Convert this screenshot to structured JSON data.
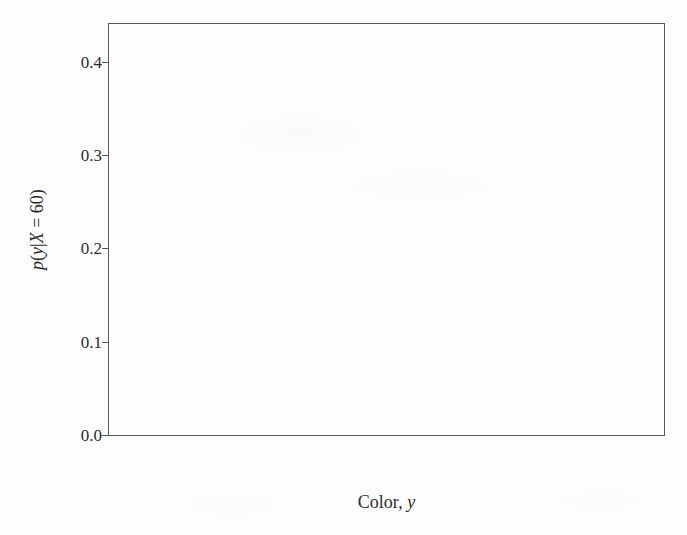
{
  "figure": {
    "background_color": "#fefefe",
    "axis_color": "#58585a",
    "stem_color": "#6a6a6c",
    "text_color": "#2b2b2b"
  },
  "axes": {
    "xlabel_prefix": "Color, ",
    "xlabel_italic": "y",
    "ylabel_parts": {
      "p": "p",
      "open": "(",
      "y": "y",
      "bar": "|",
      "X": "X",
      "eq": " = 60",
      "close": ")"
    },
    "ylabel_plain": "p(y|X = 60)",
    "ytick_labels": [
      "0.0",
      "0.1",
      "0.2",
      "0.3",
      "0.4"
    ],
    "ytick_values": [
      0.0,
      0.1,
      0.2,
      0.3,
      0.4
    ],
    "xtick_labels": [
      "Red",
      "Gray",
      "Green"
    ]
  },
  "chart_data": {
    "type": "bar",
    "subtype": "stem",
    "title": "",
    "subtitle": "",
    "xlabel": "Color, y",
    "ylabel": "p(y|X = 60)",
    "categories": [
      "Red",
      "Gray",
      "Green"
    ],
    "values": [
      0.2,
      0.4,
      0.398
    ],
    "ylim": [
      0.0,
      0.4405
    ],
    "xlim": [
      0.0,
      1.0
    ],
    "ytick_values": [
      0.0,
      0.1,
      0.2,
      0.3,
      0.4
    ],
    "ytick_labels": [
      "0.0",
      "0.1",
      "0.2",
      "0.3",
      "0.4"
    ],
    "xtick_positions": [
      0.0951,
      0.4973,
      0.8977
    ],
    "grid": false,
    "legend": null,
    "legend_position": "none",
    "series": [
      {
        "name": "p(y|X = 60)",
        "values": [
          0.2,
          0.4,
          0.398
        ]
      }
    ],
    "annotations": []
  }
}
